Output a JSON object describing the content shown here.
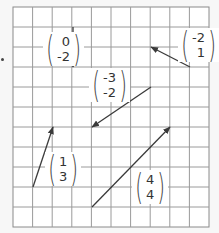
{
  "grid": {
    "left": 13,
    "top": 7,
    "cell_w": 19.6,
    "cell_h": 20,
    "cols": 10,
    "rows": 11,
    "line_color": "#9a9a9a",
    "border_color": "#8a8a8a",
    "background": "#ffffff"
  },
  "arrow_color": "#3a3a3a",
  "vectors": [
    {
      "id": "v1",
      "x": "0",
      "y": "-2",
      "tail": [
        73,
        27
      ],
      "head": [
        73,
        67
      ],
      "label_pos": [
        43,
        32
      ]
    },
    {
      "id": "v2",
      "x": "-2",
      "y": "1",
      "tail": [
        190,
        67
      ],
      "head": [
        151,
        47
      ],
      "label_pos": [
        178,
        28
      ]
    },
    {
      "id": "v3",
      "x": "-3",
      "y": "-2",
      "tail": [
        151,
        87
      ],
      "head": [
        92,
        127
      ],
      "label_pos": [
        89,
        68
      ]
    },
    {
      "id": "v4",
      "x": "1",
      "y": "3",
      "tail": [
        33,
        187
      ],
      "head": [
        53,
        127
      ],
      "label_pos": [
        45,
        152
      ]
    },
    {
      "id": "v5",
      "x": "4",
      "y": "4",
      "tail": [
        92,
        207
      ],
      "head": [
        170,
        127
      ],
      "label_pos": [
        132,
        170
      ]
    }
  ]
}
